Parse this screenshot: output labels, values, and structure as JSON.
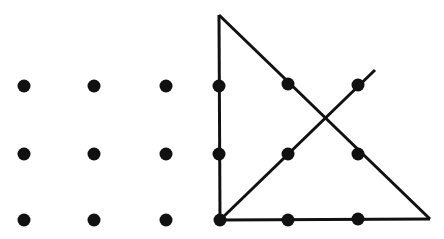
{
  "diagram": {
    "colors": {
      "background": "#ffffff",
      "ink": "#111111"
    },
    "dot_radius": 6.5,
    "dots": [
      {
        "x": 24,
        "y": 86
      },
      {
        "x": 94,
        "y": 86
      },
      {
        "x": 166,
        "y": 86
      },
      {
        "x": 219,
        "y": 86
      },
      {
        "x": 288,
        "y": 84
      },
      {
        "x": 358,
        "y": 85
      },
      {
        "x": 24,
        "y": 154
      },
      {
        "x": 94,
        "y": 154
      },
      {
        "x": 166,
        "y": 154
      },
      {
        "x": 219,
        "y": 154
      },
      {
        "x": 288,
        "y": 154
      },
      {
        "x": 358,
        "y": 154
      },
      {
        "x": 24,
        "y": 220
      },
      {
        "x": 94,
        "y": 220
      },
      {
        "x": 166,
        "y": 220
      },
      {
        "x": 220,
        "y": 220
      },
      {
        "x": 288,
        "y": 220
      },
      {
        "x": 358,
        "y": 219
      }
    ],
    "lines": [
      {
        "name": "vertical-edge",
        "x1": 219,
        "y1": 15,
        "x2": 220,
        "y2": 220
      },
      {
        "name": "hypotenuse-edge",
        "x1": 219,
        "y1": 15,
        "x2": 430,
        "y2": 219
      },
      {
        "name": "base-edge",
        "x1": 220,
        "y1": 220,
        "x2": 430,
        "y2": 219
      },
      {
        "name": "diagonal-line",
        "x1": 220,
        "y1": 220,
        "x2": 375,
        "y2": 70
      }
    ],
    "stroke_width": 3
  }
}
